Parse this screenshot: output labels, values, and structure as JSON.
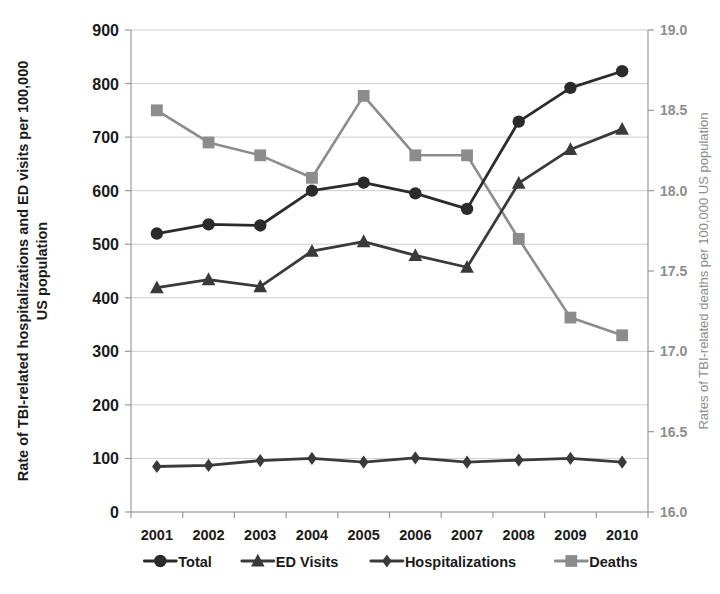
{
  "chart_data": {
    "type": "line",
    "title": "",
    "xlabel": "",
    "categories": [
      "2001",
      "2002",
      "2003",
      "2004",
      "2005",
      "2006",
      "2007",
      "2008",
      "2009",
      "2010"
    ],
    "x": [
      2001,
      2002,
      2003,
      2004,
      2005,
      2006,
      2007,
      2008,
      2009,
      2010
    ],
    "grid": true,
    "legend_position": "bottom",
    "axes": {
      "left": {
        "label": "Rate of TBI-related hospitalizations and ED visits per 100,000 US population",
        "ylim": [
          0,
          900
        ],
        "ticks": [
          0,
          100,
          200,
          300,
          400,
          500,
          600,
          700,
          800,
          900
        ],
        "tick_labels": [
          "0",
          "100",
          "200",
          "300",
          "400",
          "500",
          "600",
          "700",
          "800",
          "900"
        ],
        "color": "#1a1a1a"
      },
      "right": {
        "label": "Rates of TBI-related deaths per 100,000 US population",
        "ylim": [
          16.0,
          19.0
        ],
        "ticks": [
          16.0,
          16.5,
          17.0,
          17.5,
          18.0,
          18.5,
          19.0
        ],
        "tick_labels": [
          "16.0",
          "16.5",
          "17.0",
          "17.5",
          "18.0",
          "18.5",
          "19.0"
        ],
        "color": "#8c8c8c"
      }
    },
    "series": [
      {
        "name": "Total",
        "axis": "left",
        "marker": "circle",
        "color": "#2b2b2b",
        "values": [
          520,
          537,
          535,
          600,
          615,
          595,
          566,
          729,
          792,
          823
        ]
      },
      {
        "name": "ED Visits",
        "axis": "left",
        "marker": "triangle",
        "color": "#3a3a3a",
        "values": [
          419,
          434,
          421,
          487,
          505,
          479,
          457,
          614,
          677,
          715
        ]
      },
      {
        "name": "Hospitalizations",
        "axis": "left",
        "marker": "diamond",
        "color": "#3a3a3a",
        "values": [
          85,
          87,
          96,
          100,
          93,
          101,
          93,
          97,
          100,
          93
        ]
      },
      {
        "name": "Deaths",
        "axis": "right",
        "marker": "square",
        "color": "#8c8c8c",
        "values": [
          18.5,
          18.3,
          18.22,
          18.08,
          18.59,
          18.22,
          18.22,
          17.7,
          17.21,
          17.1
        ]
      }
    ]
  },
  "legend": {
    "items": [
      {
        "label": "Total",
        "marker": "circle",
        "color": "#2b2b2b"
      },
      {
        "label": "ED Visits",
        "marker": "triangle",
        "color": "#3a3a3a"
      },
      {
        "label": "Hospitalizations",
        "marker": "diamond",
        "color": "#3a3a3a"
      },
      {
        "label": "Deaths",
        "marker": "square",
        "color": "#8c8c8c"
      }
    ]
  },
  "colors": {
    "background": "#ffffff",
    "grid": "#c9c9c9",
    "axis": "#9a9a9a",
    "left_axis_text": "#1a1a1a",
    "right_axis_text": "#8c8c8c"
  }
}
